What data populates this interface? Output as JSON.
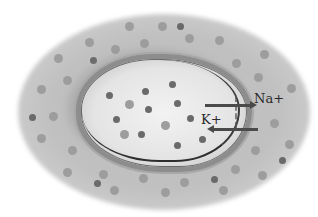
{
  "diagram": {
    "type": "cell membrane ion transport",
    "labels": {
      "sodium": "Na+",
      "potassium": "K+"
    },
    "arrows": [
      {
        "ion": "Na+",
        "direction": "out"
      },
      {
        "ion": "K+",
        "direction": "in"
      }
    ],
    "colors": {
      "extracellular": "#c4c4c4",
      "intracellular": "#e8e8e8",
      "membrane": "#8d8d8d",
      "arrow": "#4a4a4a"
    },
    "dots_outside": [
      [
        129,
        26,
        "l"
      ],
      [
        162,
        26,
        "l"
      ],
      [
        180,
        26,
        "d"
      ],
      [
        89,
        42,
        "l"
      ],
      [
        144,
        43,
        "l"
      ],
      [
        189,
        38,
        "l"
      ],
      [
        219,
        40,
        "l"
      ],
      [
        58,
        58,
        "l"
      ],
      [
        115,
        49,
        "l"
      ],
      [
        93,
        60,
        "d"
      ],
      [
        236,
        63,
        "l"
      ],
      [
        264,
        54,
        "l"
      ],
      [
        67,
        80,
        "l"
      ],
      [
        258,
        77,
        "l"
      ],
      [
        41,
        89,
        "l"
      ],
      [
        291,
        88,
        "l"
      ],
      [
        53,
        116,
        "l"
      ],
      [
        32,
        117,
        "d"
      ],
      [
        274,
        123,
        "l"
      ],
      [
        41,
        138,
        "l"
      ],
      [
        289,
        144,
        "l"
      ],
      [
        72,
        150,
        "l"
      ],
      [
        255,
        150,
        "l"
      ],
      [
        282,
        160,
        "d"
      ],
      [
        67,
        172,
        "l"
      ],
      [
        103,
        174,
        "l"
      ],
      [
        97,
        183,
        "d"
      ],
      [
        143,
        178,
        "l"
      ],
      [
        184,
        182,
        "l"
      ],
      [
        214,
        179,
        "d"
      ],
      [
        235,
        169,
        "l"
      ],
      [
        262,
        175,
        "l"
      ],
      [
        114,
        190,
        "l"
      ],
      [
        165,
        192,
        "l"
      ],
      [
        223,
        190,
        "l"
      ]
    ],
    "dots_inside": [
      [
        172,
        84,
        "d"
      ],
      [
        145,
        91,
        "d"
      ],
      [
        109,
        95,
        "d"
      ],
      [
        129,
        104,
        "l"
      ],
      [
        148,
        109,
        "d"
      ],
      [
        177,
        103,
        "d"
      ],
      [
        116,
        119,
        "d"
      ],
      [
        190,
        118,
        "d"
      ],
      [
        165,
        125,
        "l"
      ],
      [
        124,
        134,
        "l"
      ],
      [
        141,
        134,
        "d"
      ],
      [
        202,
        139,
        "d"
      ],
      [
        177,
        145,
        "d"
      ]
    ]
  }
}
